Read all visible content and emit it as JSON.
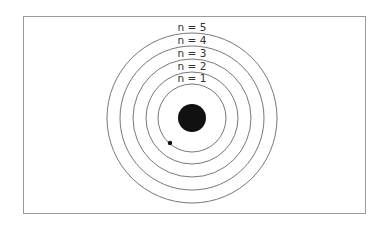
{
  "diagram": {
    "center": {
      "x": 192,
      "y": 118
    },
    "nucleus": {
      "radius": 14,
      "color": "#111111"
    },
    "electron": {
      "x": 170,
      "y": 143,
      "radius": 2.2,
      "color": "#111111"
    },
    "ring_color": "#555555",
    "orbits": [
      {
        "label": "n = 1",
        "radius": 34
      },
      {
        "label": "n = 2",
        "radius": 46
      },
      {
        "label": "n = 3",
        "radius": 59
      },
      {
        "label": "n = 4",
        "radius": 72
      },
      {
        "label": "n = 5",
        "radius": 85
      }
    ]
  }
}
